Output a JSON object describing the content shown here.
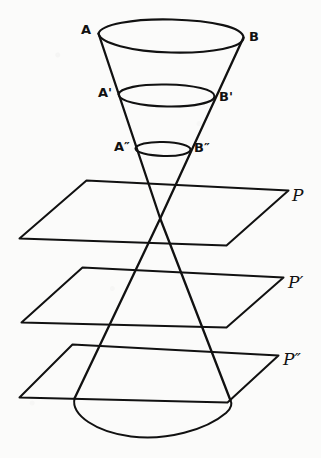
{
  "figure": {
    "background_color": "#fbfbfa",
    "ink_color": "#111111",
    "width": 321,
    "height": 458
  },
  "cone": {
    "apex_label": "",
    "upper_nappe_rim_labels": {
      "left": "A",
      "right": "B"
    },
    "sections": [
      {
        "name": "top-circle",
        "left_label": "A",
        "right_label": "B"
      },
      {
        "name": "middle-circle",
        "left_label": "A'",
        "right_label": "B'"
      },
      {
        "name": "small-circle",
        "left_label": "A″",
        "right_label": "B″"
      }
    ]
  },
  "labels": {
    "A": "A",
    "B": "B",
    "A_prime": "A'",
    "B_prime": "B'",
    "A_double_prime": "A″",
    "B_double_prime": "B″"
  },
  "planes": [
    {
      "id": "plane-p",
      "label": "P"
    },
    {
      "id": "plane-p-prime",
      "label": "P′"
    },
    {
      "id": "plane-p-dprime",
      "label": "P″"
    }
  ]
}
